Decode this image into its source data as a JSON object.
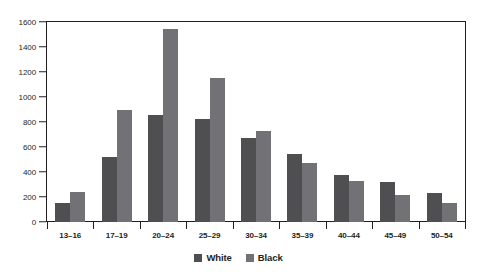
{
  "chart_data": {
    "type": "bar",
    "title": "",
    "xlabel": "",
    "ylabel": "",
    "ylim": [
      0,
      1600
    ],
    "yticks": [
      0,
      200,
      400,
      600,
      800,
      1000,
      1200,
      1400,
      1600
    ],
    "grid": false,
    "legend_position": "bottom-center",
    "categories": [
      "13–16",
      "17–19",
      "20–24",
      "25–29",
      "30–34",
      "35–39",
      "40–44",
      "45–49",
      "50–54"
    ],
    "series": [
      {
        "name": "White",
        "color": "#4f4f51",
        "values": [
          155,
          520,
          855,
          825,
          670,
          545,
          380,
          320,
          235
        ]
      },
      {
        "name": "Black",
        "color": "#727276",
        "values": [
          240,
          900,
          1545,
          1150,
          725,
          470,
          330,
          215,
          155
        ]
      }
    ]
  },
  "legend": {
    "items": [
      {
        "label": "White",
        "swatch": "white-series-swatch"
      },
      {
        "label": "Black",
        "swatch": "black-series-swatch"
      }
    ]
  },
  "axis": {
    "y_tick_labels": [
      "0",
      "200",
      "400",
      "600",
      "800",
      "1000",
      "1200",
      "1400",
      "1600"
    ]
  },
  "colors": {
    "white_series": "#4f4f51",
    "black_series": "#727276",
    "axis": "#231f20",
    "background": "#ffffff"
  }
}
